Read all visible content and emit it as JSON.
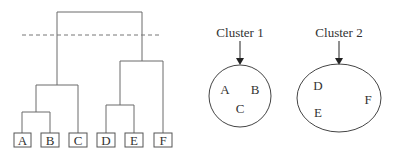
{
  "dendrogram": {
    "leaves": [
      "A",
      "B",
      "C",
      "D",
      "E",
      "F"
    ],
    "cut_line": "dashed"
  },
  "clusters": [
    {
      "label": "Cluster 1",
      "members": [
        "A",
        "B",
        "C"
      ]
    },
    {
      "label": "Cluster 2",
      "members": [
        "D",
        "E",
        "F"
      ]
    }
  ],
  "colors": {
    "line": "#6b6b6b",
    "text": "#333333",
    "background": "#ffffff"
  }
}
